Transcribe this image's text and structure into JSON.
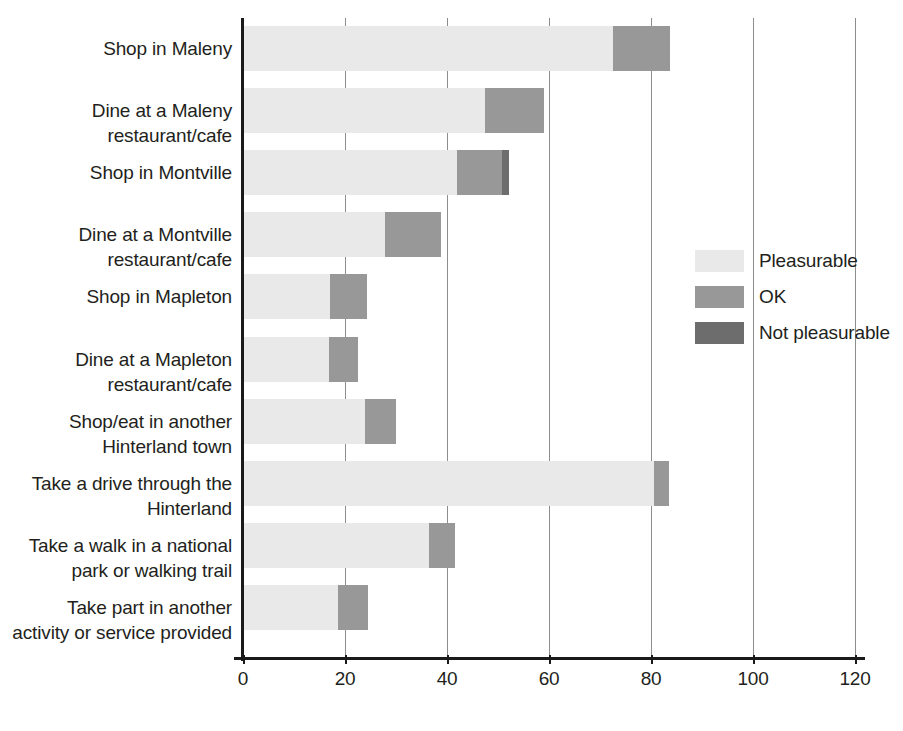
{
  "chart_data": {
    "type": "bar",
    "orientation": "horizontal",
    "stacked": true,
    "title": "",
    "xlabel": "",
    "ylabel": "",
    "xlim": [
      0,
      120
    ],
    "x_ticks": [
      0,
      20,
      40,
      60,
      80,
      100,
      120
    ],
    "x_tick_labels": [
      "0",
      "20",
      "40",
      "60",
      "80",
      "100",
      "120"
    ],
    "grid": "vertical",
    "legend_position": "right",
    "categories": [
      "Shop in Maleny",
      "Dine at a Maleny restaurant/cafe",
      "Shop in Montville",
      "Dine at a Montville restaurant/cafe",
      "Shop in Mapleton",
      "Dine at a Mapleton restaurant/cafe",
      "Shop/eat in another Hinterland town",
      "Take a drive through the Hinterland",
      "Take a walk in a national park or walking trail",
      "Take part in another activity or service provided"
    ],
    "series": [
      {
        "name": "Pleasurable",
        "color": "#e9e9e9",
        "values": [
          72.5,
          47.5,
          42.0,
          27.8,
          17.0,
          16.9,
          24.0,
          80.5,
          36.5,
          18.6
        ]
      },
      {
        "name": "OK",
        "color": "#989898",
        "values": [
          11.2,
          11.6,
          8.8,
          11.1,
          7.4,
          5.6,
          6.0,
          3.0,
          5.0,
          6.0
        ]
      },
      {
        "name": "Not pleasurable",
        "color": "#6d6d6d",
        "values": [
          0.0,
          0.0,
          1.4,
          0.0,
          0.0,
          0.0,
          0.0,
          0.0,
          0.0,
          0.0
        ]
      }
    ],
    "legend_entries": [
      "Pleasurable",
      "OK",
      "Not pleasurable"
    ]
  },
  "categories_display": [
    {
      "line1": "Shop in Maleny",
      "line2": ""
    },
    {
      "line1": "Dine at a Maleny",
      "line2": "restaurant/cafe"
    },
    {
      "line1": "Shop in Montville",
      "line2": ""
    },
    {
      "line1": "Dine at a Montville",
      "line2": "restaurant/cafe"
    },
    {
      "line1": "Shop in Mapleton",
      "line2": ""
    },
    {
      "line1": "Dine at a Mapleton",
      "line2": "restaurant/cafe"
    },
    {
      "line1": "Shop/eat in another",
      "line2": "Hinterland town"
    },
    {
      "line1": "Take a drive through the",
      "line2": "Hinterland"
    },
    {
      "line1": "Take a walk in a national",
      "line2": "park or walking trail"
    },
    {
      "line1": "Take part in another",
      "line2": "activity or service provided"
    }
  ],
  "axis": {
    "tick_labels": [
      "0",
      "20",
      "40",
      "60",
      "80",
      "100",
      "120"
    ]
  },
  "legend": {
    "items": [
      {
        "label": "Pleasurable",
        "color": "#e9e9e9"
      },
      {
        "label": "OK",
        "color": "#989898"
      },
      {
        "label": "Not pleasurable",
        "color": "#6d6d6d"
      }
    ]
  }
}
